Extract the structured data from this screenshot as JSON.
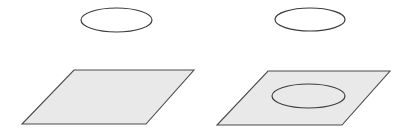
{
  "figure": {
    "canvas": {
      "width": 414,
      "height": 137,
      "background": "#ffffff"
    },
    "style": {
      "plane_fill": "#e9e9e9",
      "plane_stroke": "#4a4a4a",
      "plane_stroke_width": 1.1,
      "curve_stroke": "#3c3c3c",
      "curve_stroke_width": 1.2,
      "curve_fill": "none"
    },
    "panels": [
      {
        "id": "panel-left",
        "name": "circle-above-plane",
        "label": "",
        "shapes": [
          {
            "id": "left-floating-ellipse",
            "name": "floating-circle",
            "type": "ellipse",
            "cx": 116.5,
            "cy": 20.0,
            "rx": 35.5,
            "ry": 12.0,
            "fill": "none",
            "stroke": "#3c3c3c"
          },
          {
            "id": "left-plane",
            "name": "plane-parallelogram",
            "type": "polygon",
            "points": "74,70 194,70 146,124 22,124",
            "fill": "#e9e9e9",
            "stroke": "#4a4a4a"
          }
        ]
      },
      {
        "id": "panel-right",
        "name": "circle-on-plane",
        "label": "",
        "shapes": [
          {
            "id": "right-floating-ellipse",
            "name": "floating-circle",
            "type": "ellipse",
            "cx": 310.0,
            "cy": 19.5,
            "rx": 35.0,
            "ry": 11.5,
            "fill": "none",
            "stroke": "#3c3c3c"
          },
          {
            "id": "right-plane",
            "name": "plane-parallelogram",
            "type": "polygon",
            "points": "268,71 390,71 342,125 217,125",
            "fill": "#e9e9e9",
            "stroke": "#4a4a4a"
          },
          {
            "id": "right-projected-ellipse",
            "name": "projected-circle",
            "type": "ellipse",
            "cx": 308.5,
            "cy": 96.0,
            "rx": 36.5,
            "ry": 12.0,
            "fill": "none",
            "stroke": "#3c3c3c"
          }
        ]
      }
    ]
  }
}
